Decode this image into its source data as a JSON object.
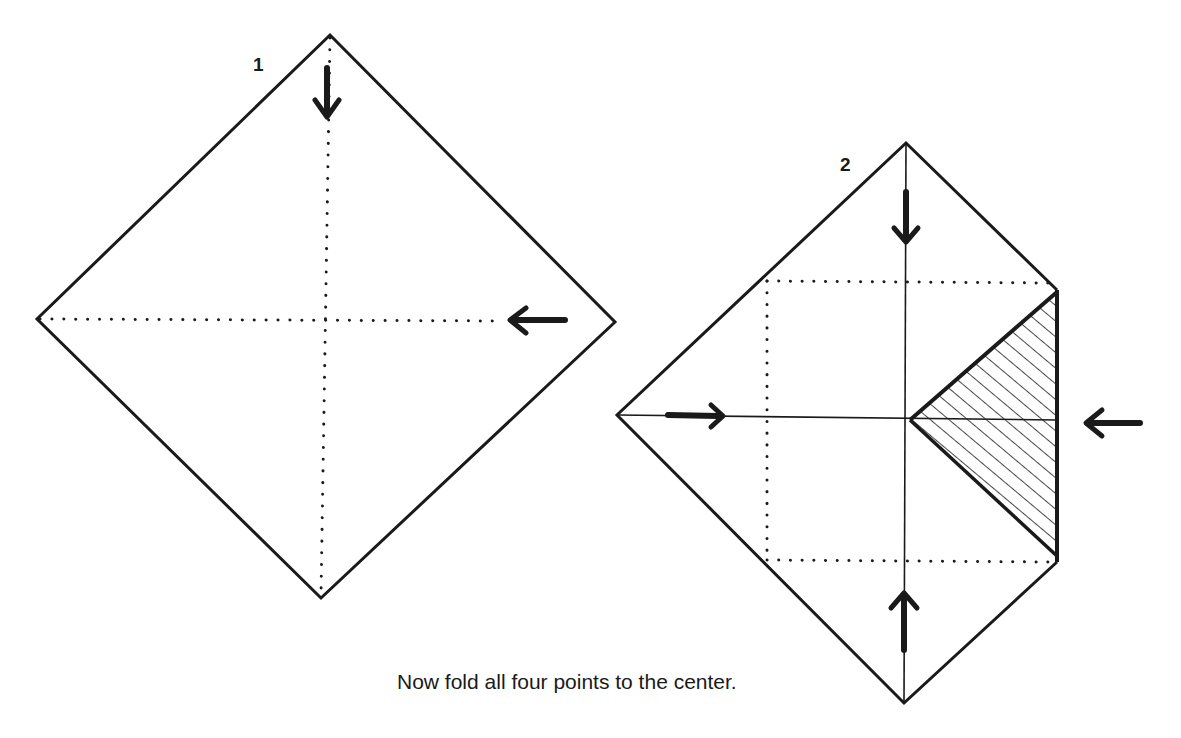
{
  "labels": {
    "step1": "1",
    "step2": "2",
    "caption": "Now fold all four points to the center."
  },
  "colors": {
    "ink": "#1a1a1a",
    "background": "#ffffff"
  },
  "diagram1": {
    "top": [
      330,
      35
    ],
    "right": [
      615,
      322
    ],
    "bottom": [
      321,
      598
    ],
    "left": [
      37,
      319
    ],
    "fold_lines": "dotted",
    "arrows": [
      {
        "direction": "down",
        "position": "top"
      },
      {
        "direction": "left",
        "position": "right"
      }
    ]
  },
  "diagram2": {
    "top": [
      906,
      143
    ],
    "right_top": [
      1057,
      290
    ],
    "right_bottom": [
      1057,
      562
    ],
    "bottom": [
      904,
      703
    ],
    "left": [
      617,
      415
    ],
    "center": [
      910,
      420
    ],
    "inner_square_dotted": {
      "left": 767,
      "top": 281,
      "right": 1057,
      "bottom": 561
    },
    "hatched_region": "right point folded to center",
    "arrows": [
      {
        "direction": "down",
        "position": "top"
      },
      {
        "direction": "right",
        "position": "left"
      },
      {
        "direction": "left",
        "position": "right"
      },
      {
        "direction": "up",
        "position": "bottom"
      }
    ]
  }
}
